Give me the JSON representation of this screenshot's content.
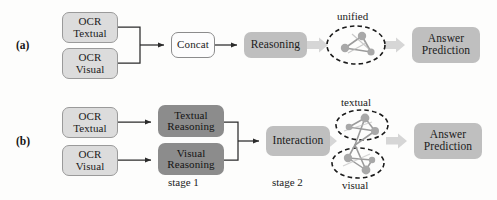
{
  "figure": {
    "rows": [
      {
        "id": "a",
        "label": "(a)",
        "nodes": {
          "ocr_textual": {
            "line1": "OCR",
            "line2": "Textual"
          },
          "ocr_visual": {
            "line1": "OCR",
            "line2": "Visual"
          },
          "concat": {
            "line1": "Concat"
          },
          "reasoning": {
            "line1": "Reasoning"
          },
          "answer": {
            "line1": "Answer",
            "line2": "Prediction"
          }
        },
        "graph_label": "unified"
      },
      {
        "id": "b",
        "label": "(b)",
        "nodes": {
          "ocr_textual": {
            "line1": "OCR",
            "line2": "Textual"
          },
          "ocr_visual": {
            "line1": "OCR",
            "line2": "Visual"
          },
          "textual_reasoning": {
            "line1": "Textual",
            "line2": "Reasoning"
          },
          "visual_reasoning": {
            "line1": "Visual",
            "line2": "Reasoning"
          },
          "interaction": {
            "line1": "Interaction"
          },
          "answer": {
            "line1": "Answer",
            "line2": "Prediction"
          }
        },
        "captions": {
          "stage1": "stage 1",
          "stage2": "stage 2"
        },
        "graph_labels": {
          "top": "textual",
          "bottom": "visual"
        }
      }
    ],
    "colors": {
      "light_box_fill": "#dcdcdc",
      "light_box_border": "#9a9a9a",
      "white_box_fill": "#fdfdfd",
      "mid_box_fill": "#bfbfbf",
      "dark_box_fill": "#8c8c8c",
      "thin_arrow": "#2b2b2b",
      "block_arrow": "#d6d6d6",
      "graph_node": "#a8a8a8",
      "graph_edge": "#9b9b9b",
      "dashed_ellipse": "#1b1b1b",
      "background": "#fdfdfc"
    }
  }
}
